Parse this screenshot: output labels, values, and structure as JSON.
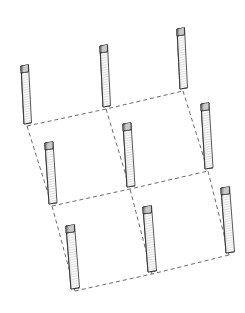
{
  "figure": {
    "background_color": "#ffffff",
    "width": 245,
    "height": 313
  },
  "style": {
    "dash_color": "#5a5a5a",
    "dash_width": 0.9,
    "dash_pattern": "4,3",
    "post_outline_color": "#2b2b2b",
    "post_outline_width": 0.8,
    "post_face_light": "#fbfbfb",
    "post_face_shade": "#ededed",
    "post_edge_dark": "#3a3a3a",
    "post_cap_color": "#9a9a9a",
    "post_cap_dark": "#6f6f6f",
    "hatch_color": "#b9b9b9",
    "hatch_width": 0.4,
    "hatch_spacing": 2.4
  },
  "grid": {
    "rows": 3,
    "cols": 3,
    "note": "3 by 3 arrangement of posts connected at their bases by dashed lines"
  },
  "posts": [
    {
      "id": "post-r1-c1",
      "row": 1,
      "col": 1,
      "base_x": 24,
      "base_y": 124,
      "top_x": 21,
      "top_y": 66,
      "width": 7.5,
      "cap_height": 7
    },
    {
      "id": "post-r1-c2",
      "row": 1,
      "col": 2,
      "base_x": 103,
      "base_y": 107,
      "top_x": 100,
      "top_y": 46,
      "width": 7.5,
      "cap_height": 7
    },
    {
      "id": "post-r1-c3",
      "row": 1,
      "col": 3,
      "base_x": 180,
      "base_y": 89,
      "top_x": 177,
      "top_y": 29,
      "width": 7.5,
      "cap_height": 7
    },
    {
      "id": "post-r2-c1",
      "row": 2,
      "col": 1,
      "base_x": 49,
      "base_y": 204,
      "top_x": 45,
      "top_y": 143,
      "width": 8,
      "cap_height": 7
    },
    {
      "id": "post-r2-c2",
      "row": 2,
      "col": 2,
      "base_x": 127,
      "base_y": 187,
      "top_x": 123,
      "top_y": 124,
      "width": 8,
      "cap_height": 7
    },
    {
      "id": "post-r2-c3",
      "row": 2,
      "col": 3,
      "base_x": 205,
      "base_y": 169,
      "top_x": 201,
      "top_y": 104,
      "width": 8,
      "cap_height": 7
    },
    {
      "id": "post-r3-c1",
      "row": 3,
      "col": 1,
      "base_x": 71,
      "base_y": 289,
      "top_x": 66,
      "top_y": 226,
      "width": 8.5,
      "cap_height": 7
    },
    {
      "id": "post-r3-c2",
      "row": 3,
      "col": 2,
      "base_x": 148,
      "base_y": 272,
      "top_x": 143,
      "top_y": 207,
      "width": 8.5,
      "cap_height": 7
    },
    {
      "id": "post-r3-c3",
      "row": 3,
      "col": 3,
      "base_x": 226,
      "base_y": 253,
      "top_x": 221,
      "top_y": 188,
      "width": 8.5,
      "cap_height": 7
    }
  ],
  "connections": [
    {
      "id": "row-line-1",
      "kind": "row",
      "from": "post-r1-c1",
      "to": "post-r1-c3",
      "points": "27,126 106,109 183,91"
    },
    {
      "id": "row-line-2",
      "kind": "row",
      "from": "post-r2-c1",
      "to": "post-r2-c3",
      "points": "52,206 130,189 208,171"
    },
    {
      "id": "row-line-3",
      "kind": "row",
      "from": "post-r3-c1",
      "to": "post-r3-c3",
      "points": "75,291 152,274 229,255"
    },
    {
      "id": "col-line-1",
      "kind": "column",
      "from": "post-r1-c1",
      "to": "post-r3-c1",
      "points": "27,126 52,206 75,291"
    },
    {
      "id": "col-line-2",
      "kind": "column",
      "from": "post-r1-c2",
      "to": "post-r3-c2",
      "points": "106,109 130,189 152,274"
    },
    {
      "id": "col-line-3",
      "kind": "column",
      "from": "post-r1-c3",
      "to": "post-r3-c3",
      "points": "183,91 208,171 229,255"
    }
  ]
}
